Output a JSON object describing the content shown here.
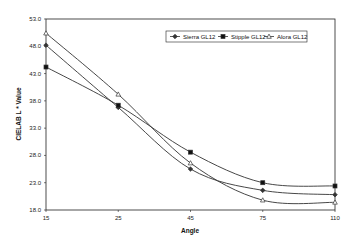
{
  "chart_data": {
    "type": "line",
    "title": "",
    "xlabel": "Angle",
    "ylabel": "CIELAB L * Value",
    "categories": [
      "15",
      "25",
      "45",
      "75",
      "110"
    ],
    "x_ticks": [
      "15",
      "25",
      "45",
      "75",
      "110"
    ],
    "y_ticks": [
      "53.0",
      "48.0",
      "43.0",
      "38.0",
      "33.0",
      "28.0",
      "23.0",
      "18.0"
    ],
    "ylim": [
      18.0,
      53.0
    ],
    "grid": false,
    "legend_position": "top-right inside",
    "series": [
      {
        "name": "Sierra GL12",
        "marker": "diamond",
        "values": [
          48.2,
          36.8,
          25.5,
          21.6,
          20.8
        ]
      },
      {
        "name": "Stipple GL12",
        "marker": "square",
        "values": [
          44.2,
          37.2,
          28.6,
          23.0,
          22.4
        ]
      },
      {
        "name": "Alora GL12",
        "marker": "triangle",
        "values": [
          50.4,
          39.2,
          26.6,
          19.8,
          19.4
        ]
      }
    ],
    "colors": {
      "line": "#333333",
      "axis": "#222222",
      "background": "#ffffff"
    }
  }
}
